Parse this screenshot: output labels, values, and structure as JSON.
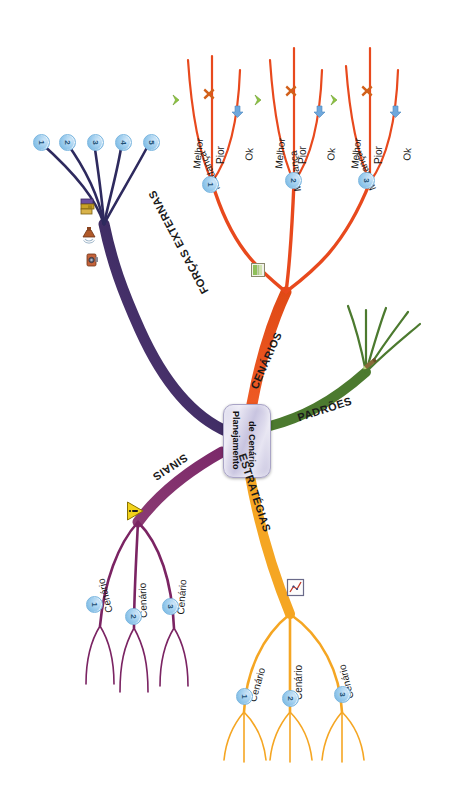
{
  "mindmap": {
    "title": "Planejamento de Cenário",
    "center": {
      "line1": "Planejamento",
      "line2": "de Cenário"
    },
    "branches": [
      {
        "id": "forcas-externas",
        "label": "FORÇAS EXTERNAS",
        "color": "#2e2a5e",
        "children": [
          {
            "badge": "1"
          },
          {
            "badge": "2"
          },
          {
            "badge": "3"
          },
          {
            "badge": "4"
          },
          {
            "badge": "5"
          }
        ],
        "icons": [
          "books-icon",
          "megaphone-icon",
          "camera-icon"
        ]
      },
      {
        "id": "cenarios",
        "label": "CENÁRIOS",
        "color": "#e8491d",
        "icons": [
          "notebook-icon"
        ],
        "children": [
          {
            "label": "Mudança",
            "badge": "1",
            "leaves": [
              {
                "label": "Melhor",
                "icon": "green-chevron-icon",
                "color": "#8ec641"
              },
              {
                "label": "Pior",
                "icon": "orange-cross-icon",
                "color": "#d2601a"
              },
              {
                "label": "Ok",
                "icon": "blue-down-arrow-icon",
                "color": "#6fa8dc"
              }
            ]
          },
          {
            "label": "Mudança",
            "badge": "2",
            "leaves": [
              {
                "label": "Melhor",
                "icon": "green-chevron-icon",
                "color": "#8ec641"
              },
              {
                "label": "Pior",
                "icon": "orange-cross-icon",
                "color": "#d2601a"
              },
              {
                "label": "Ok",
                "icon": "blue-down-arrow-icon",
                "color": "#6fa8dc"
              }
            ]
          },
          {
            "label": "Mudança",
            "badge": "3",
            "leaves": [
              {
                "label": "Melhor",
                "icon": "green-chevron-icon",
                "color": "#8ec641"
              },
              {
                "label": "Pior",
                "icon": "orange-cross-icon",
                "color": "#d2601a"
              },
              {
                "label": "Ok",
                "icon": "blue-down-arrow-icon",
                "color": "#6fa8dc"
              }
            ]
          }
        ]
      },
      {
        "id": "padroes",
        "label": "PADRÕES",
        "color": "#4c7a2f",
        "icons": [
          "pencil-icon"
        ],
        "children": []
      },
      {
        "id": "estrategias",
        "label": "ESTRATÉGIAS",
        "color": "#f5a623",
        "icons": [
          "chart-icon"
        ],
        "children": [
          {
            "label": "Cenário",
            "badge": "1"
          },
          {
            "label": "Cenário",
            "badge": "2"
          },
          {
            "label": "Cenário",
            "badge": "3"
          }
        ]
      },
      {
        "id": "sinais",
        "label": "SINAIS",
        "color": "#7b2463",
        "icons": [
          "warning-triangle-icon"
        ],
        "children": [
          {
            "label": "Cenário",
            "badge": "1"
          },
          {
            "label": "Cenário",
            "badge": "2"
          },
          {
            "label": "Cenário",
            "badge": "3"
          }
        ]
      }
    ]
  }
}
